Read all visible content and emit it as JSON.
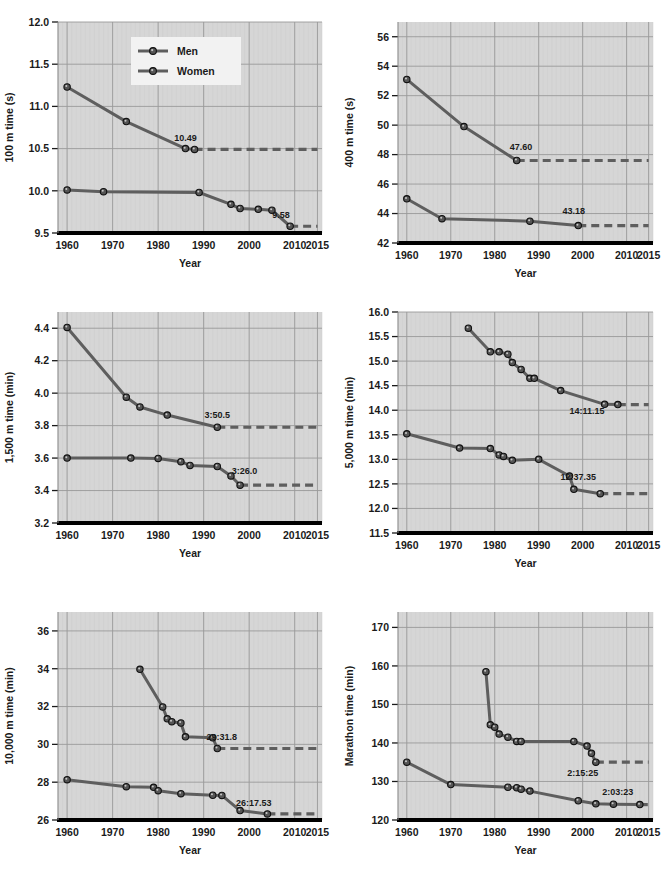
{
  "figure": {
    "legend": {
      "entries": [
        "Men",
        "Women"
      ]
    },
    "x_axis_title": "Year",
    "series_colors": {
      "men": "#5e5e5e",
      "women": "#5e5e5e"
    },
    "plot_bg": "#d6d6d6",
    "grid_color": "#9a9a9a",
    "axis_color": "#000000"
  },
  "chart_data": [
    {
      "id": "100m",
      "type": "line",
      "title": "",
      "xlabel": "Year",
      "ylabel": "100 m time (s)",
      "xlim": [
        1958,
        2016
      ],
      "ylim": [
        9.5,
        12.0
      ],
      "xticks": [
        1960,
        1970,
        1980,
        1990,
        2000,
        2010,
        2015
      ],
      "xtick_labels": [
        "1960",
        "1970",
        "1980",
        "1990",
        "2000",
        "2010",
        "2015"
      ],
      "yticks": [
        9.5,
        10.0,
        10.5,
        11.0,
        11.5,
        12.0
      ],
      "ytick_labels": [
        "9.5",
        "10.0",
        "10.5",
        "11.0",
        "11.5",
        "12.0"
      ],
      "grid": true,
      "legend_position": "top-center",
      "series": [
        {
          "name": "Women",
          "x": [
            1960,
            1973,
            1986,
            1988
          ],
          "y": [
            11.23,
            10.82,
            10.5,
            10.49
          ],
          "record_label": "10.49",
          "record_label_x": 1986,
          "record_label_y": 10.59,
          "extension_from": 1988,
          "extension_to": 2015,
          "extension_y": 10.49
        },
        {
          "name": "Men",
          "x": [
            1960,
            1968,
            1989,
            1996,
            1998,
            2002,
            2005,
            2009
          ],
          "y": [
            10.01,
            9.99,
            9.98,
            9.84,
            9.79,
            9.78,
            9.77,
            9.58
          ],
          "record_label": "9.58",
          "record_label_x": 2007,
          "record_label_y": 9.68,
          "extension_from": 2009,
          "extension_to": 2015,
          "extension_y": 9.58
        }
      ]
    },
    {
      "id": "400m",
      "type": "line",
      "title": "",
      "xlabel": "Year",
      "ylabel": "400 m time (s)",
      "xlim": [
        1958,
        2016
      ],
      "ylim": [
        42,
        57
      ],
      "xticks": [
        1960,
        1970,
        1980,
        1990,
        2000,
        2010,
        2015
      ],
      "xtick_labels": [
        "1960",
        "1970",
        "1980",
        "1990",
        "2000",
        "2010",
        "2015"
      ],
      "yticks": [
        42,
        44,
        46,
        48,
        50,
        52,
        54,
        56
      ],
      "ytick_labels": [
        "42",
        "44",
        "46",
        "48",
        "50",
        "52",
        "54",
        "56"
      ],
      "grid": true,
      "series": [
        {
          "name": "Women",
          "x": [
            1960,
            1973,
            1985
          ],
          "y": [
            53.1,
            49.9,
            47.6
          ],
          "record_label": "47.60",
          "record_label_x": 1986,
          "record_label_y": 48.3,
          "extension_from": 1985,
          "extension_to": 2015,
          "extension_y": 47.6
        },
        {
          "name": "Men",
          "x": [
            1960,
            1968,
            1988,
            1999
          ],
          "y": [
            45.0,
            43.65,
            43.48,
            43.18
          ],
          "record_label": "43.18",
          "record_label_x": 1998,
          "record_label_y": 43.95,
          "extension_from": 1999,
          "extension_to": 2015,
          "extension_y": 43.18
        }
      ]
    },
    {
      "id": "1500m",
      "type": "line",
      "title": "",
      "xlabel": "Year",
      "ylabel": "1,500 m time (min)",
      "xlim": [
        1958,
        2016
      ],
      "ylim": [
        3.2,
        4.5
      ],
      "xticks": [
        1960,
        1970,
        1980,
        1990,
        2000,
        2010,
        2015
      ],
      "xtick_labels": [
        "1960",
        "1970",
        "1980",
        "1990",
        "2000",
        "2010",
        "2015"
      ],
      "yticks": [
        3.2,
        3.4,
        3.6,
        3.8,
        4.0,
        4.2,
        4.4
      ],
      "ytick_labels": [
        "3.2",
        "3.4",
        "3.6",
        "3.8",
        "4.0",
        "4.2",
        "4.4"
      ],
      "grid": true,
      "series": [
        {
          "name": "Women",
          "x": [
            1960,
            1973,
            1976,
            1982,
            1993
          ],
          "y": [
            4.405,
            3.975,
            3.915,
            3.865,
            3.79
          ],
          "record_label": "3:50.5",
          "record_label_x": 1993,
          "record_label_y": 3.85,
          "extension_from": 1993,
          "extension_to": 2015,
          "extension_y": 3.79
        },
        {
          "name": "Men",
          "x": [
            1960,
            1974,
            1980,
            1985,
            1987,
            1993,
            1996,
            1998
          ],
          "y": [
            3.6,
            3.6,
            3.598,
            3.578,
            3.555,
            3.548,
            3.49,
            3.433
          ],
          "record_label": "3:26.0",
          "record_label_x": 1999,
          "record_label_y": 3.5,
          "extension_from": 1998,
          "extension_to": 2015,
          "extension_y": 3.433
        }
      ]
    },
    {
      "id": "5000m",
      "type": "line",
      "title": "",
      "xlabel": "Year",
      "ylabel": "5,000 m time (min)",
      "xlim": [
        1958,
        2016
      ],
      "ylim": [
        11.5,
        16.0
      ],
      "xticks": [
        1960,
        1970,
        1980,
        1990,
        2000,
        2010,
        2015
      ],
      "xtick_labels": [
        "1960",
        "1970",
        "1980",
        "1990",
        "2000",
        "2010",
        "2015"
      ],
      "yticks": [
        11.5,
        12.0,
        12.5,
        13.0,
        13.5,
        14.0,
        14.5,
        15.0,
        15.5,
        16.0
      ],
      "ytick_labels": [
        "11.5",
        "12.0",
        "12.5",
        "13.0",
        "13.5",
        "14.0",
        "14.5",
        "15.0",
        "15.5",
        "16.0"
      ],
      "grid": true,
      "series": [
        {
          "name": "Women",
          "x": [
            1974,
            1979,
            1981,
            1983,
            1984,
            1986,
            1988,
            1989,
            1995,
            2005,
            2008
          ],
          "y": [
            15.67,
            15.19,
            15.19,
            15.14,
            14.97,
            14.83,
            14.65,
            14.65,
            14.4,
            14.12,
            14.115
          ],
          "record_label": "14:11.15",
          "record_label_x": 2001,
          "record_label_y": 13.93,
          "extension_from": 2008,
          "extension_to": 2015,
          "extension_y": 14.115
        },
        {
          "name": "Men",
          "x": [
            1960,
            1972,
            1979,
            1981,
            1982,
            1984,
            1990,
            1997,
            1998,
            2004
          ],
          "y": [
            13.52,
            13.23,
            13.22,
            13.09,
            13.06,
            12.98,
            13.0,
            12.66,
            12.39,
            12.3
          ],
          "record_label": "12:37.35",
          "record_label_x": 1999,
          "record_label_y": 12.58,
          "extension_from": 2004,
          "extension_to": 2015,
          "extension_y": 12.3
        }
      ]
    },
    {
      "id": "10000m",
      "type": "line",
      "title": "",
      "xlabel": "Year",
      "ylabel": "10,000 m time (min)",
      "xlim": [
        1958,
        2016
      ],
      "ylim": [
        26,
        37
      ],
      "xticks": [
        1960,
        1970,
        1980,
        1990,
        2000,
        2010,
        2015
      ],
      "xtick_labels": [
        "1960",
        "1970",
        "1980",
        "1990",
        "2000",
        "2010",
        "2015"
      ],
      "yticks": [
        26,
        28,
        30,
        32,
        34,
        36
      ],
      "ytick_labels": [
        "26",
        "28",
        "30",
        "32",
        "34",
        "36"
      ],
      "grid": true,
      "series": [
        {
          "name": "Women",
          "x": [
            1976,
            1981,
            1982,
            1983,
            1985,
            1986,
            1992,
            1993
          ],
          "y": [
            33.97,
            31.98,
            31.35,
            31.2,
            31.13,
            30.4,
            30.35,
            29.78
          ],
          "record_label": "29:31.8",
          "record_label_x": 1994,
          "record_label_y": 30.25,
          "extension_from": 1993,
          "extension_to": 2015,
          "extension_y": 29.78
        },
        {
          "name": "Men",
          "x": [
            1960,
            1973,
            1979,
            1980,
            1985,
            1992,
            1994,
            1998,
            2004
          ],
          "y": [
            28.13,
            27.76,
            27.73,
            27.55,
            27.39,
            27.31,
            27.3,
            26.5,
            26.32
          ],
          "record_label": "26:17.53",
          "record_label_x": 2001,
          "record_label_y": 26.75,
          "extension_from": 2004,
          "extension_to": 2015,
          "extension_y": 26.32
        }
      ]
    },
    {
      "id": "marathon",
      "type": "line",
      "title": "",
      "xlabel": "Year",
      "ylabel": "Marathon time (min)",
      "xlim": [
        1958,
        2016
      ],
      "ylim": [
        120,
        174
      ],
      "xticks": [
        1960,
        1970,
        1980,
        1990,
        2000,
        2010,
        2015
      ],
      "xtick_labels": [
        "1960",
        "1970",
        "1980",
        "1990",
        "2000",
        "2010",
        "2015"
      ],
      "yticks": [
        120,
        130,
        140,
        150,
        160,
        170
      ],
      "ytick_labels": [
        "120",
        "130",
        "140",
        "150",
        "160",
        "170"
      ],
      "grid": true,
      "series": [
        {
          "name": "Women",
          "x": [
            1978,
            1979,
            1980,
            1981,
            1983,
            1985,
            1986,
            1998,
            2001,
            2002,
            2003
          ],
          "y": [
            158.5,
            144.7,
            144.1,
            142.3,
            141.5,
            140.4,
            140.4,
            140.4,
            139.2,
            137.3,
            135.0
          ],
          "record_label": "2:15:25",
          "record_label_x": 2000,
          "record_label_y": 131.5,
          "extension_from": 2003,
          "extension_to": 2015,
          "extension_y": 135.0
        },
        {
          "name": "Men",
          "x": [
            1960,
            1970,
            1983,
            1985,
            1986,
            1988,
            1999,
            2003,
            2007,
            2013
          ],
          "y": [
            135.0,
            129.2,
            128.5,
            128.4,
            128.0,
            127.5,
            125.0,
            124.2,
            124.1,
            124.0
          ],
          "record_label": "2:03:23",
          "record_label_x": 2008,
          "record_label_y": 126.5,
          "extension_from": 2013,
          "extension_to": 2015,
          "extension_y": 124.0
        }
      ]
    }
  ]
}
